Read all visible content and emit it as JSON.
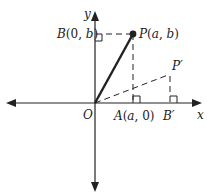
{
  "diagram": {
    "axes": {
      "x_label": "x",
      "y_label": "y",
      "origin_label": "O"
    },
    "points": {
      "P": {
        "label": "P(a, b)",
        "name": "P",
        "coords": "(a, b)"
      },
      "B": {
        "label": "B(0, b)",
        "name": "B",
        "coords": "(0, b)"
      },
      "A": {
        "label": "A(a, 0)",
        "name": "A",
        "coords": "(a, 0)"
      },
      "P_prime": {
        "label": "P′"
      },
      "B_prime": {
        "label": "B′"
      }
    },
    "colors": {
      "stroke": "#222222",
      "background": "#ffffff"
    }
  }
}
